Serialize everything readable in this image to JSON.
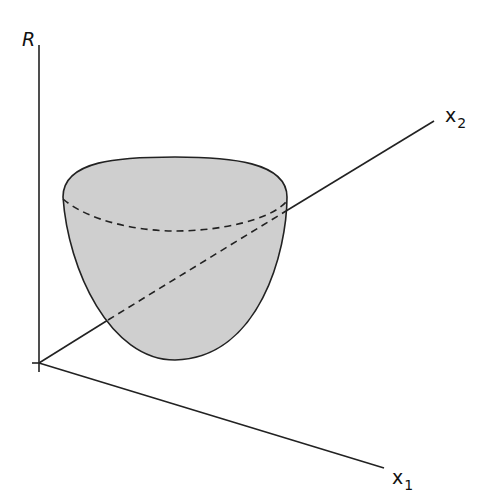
{
  "diagram": {
    "axes": {
      "vertical": {
        "label": "R"
      },
      "depth": {
        "label": "x",
        "subscript": "2"
      },
      "horizontal": {
        "label": "x",
        "subscript": "1"
      }
    },
    "colors": {
      "line": "#222222",
      "surface_fill": "#cfcfcf",
      "background": "#ffffff"
    },
    "shape": {
      "type": "paraboloid",
      "rim_style": "ellipse with solid front-top edge and dashed back edge",
      "hidden_axis_segment": "dashed where x2 axis passes behind surface"
    }
  }
}
